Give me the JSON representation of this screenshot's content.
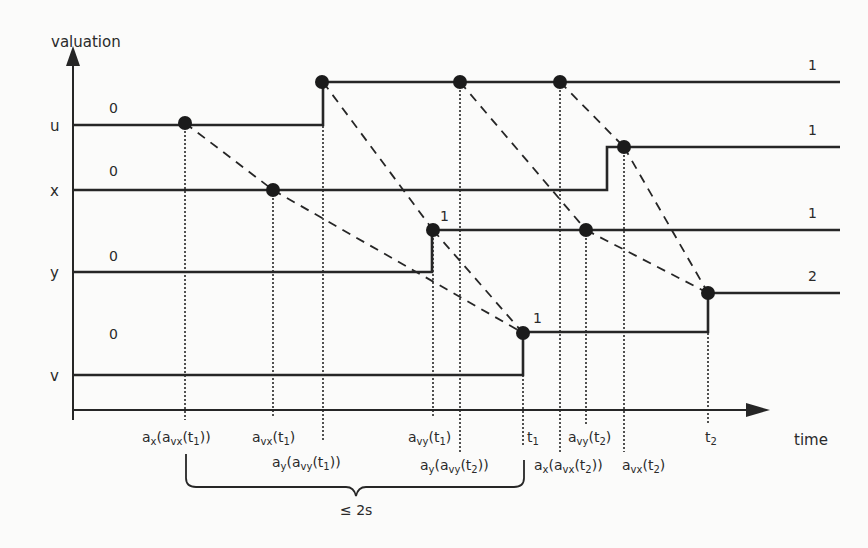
{
  "diagram": {
    "axes": {
      "y_label": "valuation",
      "x_label": "time"
    },
    "variables": [
      {
        "name": "u",
        "initial_value": "0",
        "final_value": "1"
      },
      {
        "name": "x",
        "initial_value": "0",
        "final_value": "1"
      },
      {
        "name": "y",
        "initial_value": "0",
        "final_value": "1"
      },
      {
        "name": "v",
        "initial_value": "0",
        "final_value": "2"
      }
    ],
    "step_labels": {
      "y_step": "1",
      "v_step": "1"
    },
    "time_labels": [
      {
        "id": "ax_avx_t1",
        "base": "a",
        "sub": "x",
        "open": "(a",
        "sub2": "vx",
        "rest": "(t",
        "sub3": "1",
        "close": "))"
      },
      {
        "id": "avx_t1",
        "base": "a",
        "sub": "vx",
        "rest": "(t",
        "sub3": "1",
        "close": ")"
      },
      {
        "id": "ay_avy_t1",
        "base": "a",
        "sub": "y",
        "open": "(a",
        "sub2": "vy",
        "rest": "(t",
        "sub3": "1",
        "close": "))"
      },
      {
        "id": "avy_t1",
        "base": "a",
        "sub": "vy",
        "rest": "(t",
        "sub3": "1",
        "close": ")"
      },
      {
        "id": "ay_avy_t2",
        "base": "a",
        "sub": "y",
        "open": "(a",
        "sub2": "vy",
        "rest": "(t",
        "sub3": "2",
        "close": "))"
      },
      {
        "id": "t1",
        "base": "t",
        "sub": "1"
      },
      {
        "id": "ax_avx_t2",
        "base": "a",
        "sub": "x",
        "open": "(a",
        "sub2": "vx",
        "rest": "(t",
        "sub3": "2",
        "close": "))"
      },
      {
        "id": "avy_t2",
        "base": "a",
        "sub": "vy",
        "rest": "(t",
        "sub3": "2",
        "close": ")"
      },
      {
        "id": "avx_t2",
        "base": "a",
        "sub": "vx",
        "rest": "(t",
        "sub3": "2",
        "close": ")"
      },
      {
        "id": "t2",
        "base": "t",
        "sub": "2"
      }
    ],
    "brace_label": "≤ 2s",
    "colors": {
      "ink": "#262626",
      "background": "#fbfbfa"
    }
  }
}
